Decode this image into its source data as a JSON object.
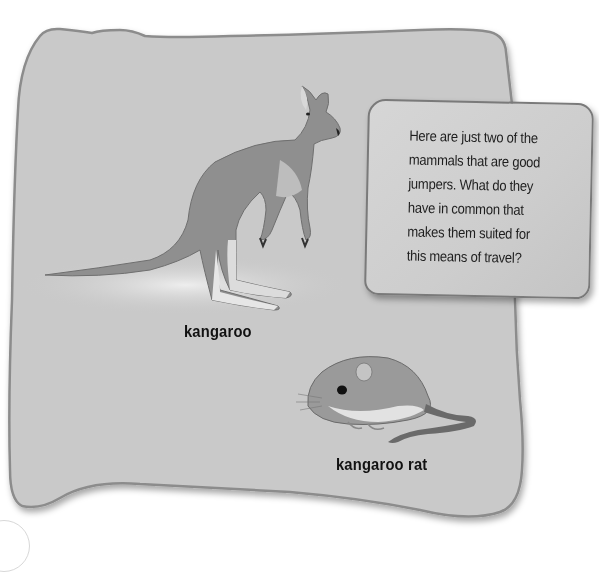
{
  "panel": {
    "background_color": "#c9c9c9",
    "border_color": "#8c8c8c"
  },
  "callout": {
    "text": "Here are just two of the\nmammals that are good\njumpers. What do they\nhave in common that\nmakes them suited for\nthis means of travel?",
    "lines": [
      "Here are just two of the",
      "mammals that are good",
      "jumpers. What do they",
      "have in common that",
      "makes them suited for",
      "this means of travel?"
    ]
  },
  "figures": [
    {
      "id": "kangaroo",
      "label": "kangaroo",
      "icon": "kangaroo-illustration"
    },
    {
      "id": "kangaroo-rat",
      "label": "kangaroo rat",
      "icon": "kangaroo-rat-illustration"
    }
  ]
}
